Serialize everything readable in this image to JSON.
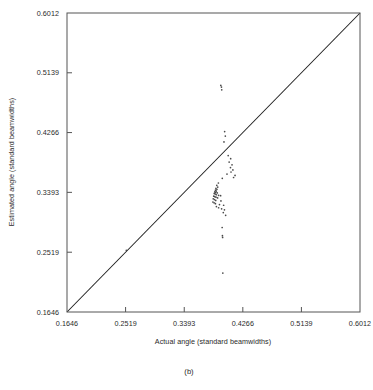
{
  "figure": {
    "caption": "(b)"
  },
  "chart_data": {
    "type": "scatter",
    "title": "",
    "xlabel": "Actual angle (standard beamwidths)",
    "ylabel": "Estimated angle (standard beamwidths)",
    "xlim": [
      0.1646,
      0.6012
    ],
    "ylim": [
      0.1646,
      0.6012
    ],
    "grid": false,
    "legend": null,
    "xticks": [
      "0.1646",
      "0.2519",
      "0.3393",
      "0.4266",
      "0.5139",
      "0.6012"
    ],
    "yticks": [
      "0.1646",
      "0.2519",
      "0.3393",
      "0.4266",
      "0.5139",
      "0.6012"
    ],
    "xtick_values": [
      0.1646,
      0.2519,
      0.3393,
      0.4266,
      0.5139,
      0.6012
    ],
    "ytick_values": [
      0.1646,
      0.2519,
      0.3393,
      0.4266,
      0.5139,
      0.6012
    ],
    "reference_line": {
      "label": "y = x identity line",
      "from": [
        0.1646,
        0.1646
      ],
      "to": [
        0.6012,
        0.6012
      ]
    },
    "marker": "dot",
    "points": [
      [
        0.3938,
        0.4955
      ],
      [
        0.3948,
        0.493
      ],
      [
        0.3952,
        0.489
      ],
      [
        0.3995,
        0.428
      ],
      [
        0.4005,
        0.4215
      ],
      [
        0.3985,
        0.413
      ],
      [
        0.4048,
        0.393
      ],
      [
        0.4085,
        0.3885
      ],
      [
        0.4062,
        0.3835
      ],
      [
        0.4105,
        0.3795
      ],
      [
        0.4082,
        0.3755
      ],
      [
        0.4118,
        0.372
      ],
      [
        0.409,
        0.369
      ],
      [
        0.403,
        0.366
      ],
      [
        0.415,
        0.364
      ],
      [
        0.4128,
        0.361
      ],
      [
        0.396,
        0.3598
      ],
      [
        0.3902,
        0.353
      ],
      [
        0.3878,
        0.3495
      ],
      [
        0.3892,
        0.347
      ],
      [
        0.3865,
        0.3452
      ],
      [
        0.388,
        0.3438
      ],
      [
        0.3858,
        0.3425
      ],
      [
        0.387,
        0.3412
      ],
      [
        0.3848,
        0.34
      ],
      [
        0.3862,
        0.3392
      ],
      [
        0.3885,
        0.3385
      ],
      [
        0.384,
        0.3378
      ],
      [
        0.3855,
        0.3368
      ],
      [
        0.3872,
        0.3358
      ],
      [
        0.3905,
        0.335
      ],
      [
        0.3935,
        0.3345
      ],
      [
        0.3832,
        0.3338
      ],
      [
        0.3848,
        0.333
      ],
      [
        0.3866,
        0.3322
      ],
      [
        0.389,
        0.3312
      ],
      [
        0.3825,
        0.33
      ],
      [
        0.3842,
        0.3288
      ],
      [
        0.3862,
        0.3275
      ],
      [
        0.394,
        0.3268
      ],
      [
        0.382,
        0.3252
      ],
      [
        0.3838,
        0.324
      ],
      [
        0.3858,
        0.3228
      ],
      [
        0.3918,
        0.3215
      ],
      [
        0.398,
        0.3205
      ],
      [
        0.3872,
        0.3185
      ],
      [
        0.3905,
        0.3168
      ],
      [
        0.395,
        0.3152
      ],
      [
        0.3992,
        0.3138
      ],
      [
        0.3975,
        0.3098
      ],
      [
        0.401,
        0.3058
      ],
      [
        0.3958,
        0.288
      ],
      [
        0.3962,
        0.276
      ],
      [
        0.3965,
        0.2735
      ],
      [
        0.253,
        0.2548
      ],
      [
        0.3968,
        0.2215
      ]
    ]
  }
}
